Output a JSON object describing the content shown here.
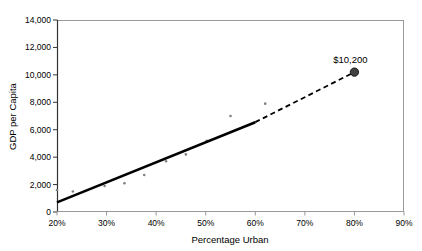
{
  "chart_data": {
    "type": "scatter",
    "title": "",
    "xlabel": "Percentage Urban",
    "ylabel": "GDP per Capita",
    "xlim": [
      20,
      90
    ],
    "ylim": [
      0,
      14000
    ],
    "grid": false,
    "legend": "none",
    "x_ticks": [
      "20%",
      "30%",
      "40%",
      "50%",
      "60%",
      "70%",
      "80%",
      "90%"
    ],
    "x_tick_values": [
      20,
      30,
      40,
      50,
      60,
      70,
      80,
      90
    ],
    "y_ticks": [
      "0",
      "2,000",
      "4,000",
      "6,000",
      "8,000",
      "10,000",
      "12,000",
      "14,000"
    ],
    "y_tick_values": [
      0,
      2000,
      4000,
      6000,
      8000,
      10000,
      12000,
      14000
    ],
    "series": [
      {
        "name": "Countries",
        "type": "scatter",
        "marker": "small-gray-dot",
        "color": "#808080",
        "points": [
          {
            "x": 20.0,
            "y": 1600
          },
          {
            "x": 23.2,
            "y": 1500
          },
          {
            "x": 29.6,
            "y": 1900
          },
          {
            "x": 33.6,
            "y": 2100
          },
          {
            "x": 37.6,
            "y": 2700
          },
          {
            "x": 42.0,
            "y": 3700
          },
          {
            "x": 46.0,
            "y": 4200
          },
          {
            "x": 50.2,
            "y": 5200
          },
          {
            "x": 55.0,
            "y": 7000
          },
          {
            "x": 62.0,
            "y": 7900
          }
        ]
      },
      {
        "name": "Trend line (fitted)",
        "type": "line",
        "style": "solid",
        "color": "#000000",
        "points": [
          {
            "x": 20.0,
            "y": 700
          },
          {
            "x": 60.0,
            "y": 6550
          }
        ]
      },
      {
        "name": "Trend line (projected)",
        "type": "line",
        "style": "dashed",
        "color": "#000000",
        "points": [
          {
            "x": 60.0,
            "y": 6550
          },
          {
            "x": 80.0,
            "y": 10200
          }
        ]
      },
      {
        "name": "Projected value",
        "type": "scatter",
        "marker": "large-dark-dot",
        "color": "#404040",
        "points": [
          {
            "x": 80.0,
            "y": 10200,
            "label": "$10,200"
          }
        ]
      }
    ],
    "annotations": [
      {
        "text": "$10,200",
        "x": 80.0,
        "y": 10200
      }
    ]
  },
  "axes": {
    "y_title": "GDP per Capita",
    "x_title": "Percentage Urban",
    "axis_color": "#999999",
    "frame_color": "#999999"
  }
}
